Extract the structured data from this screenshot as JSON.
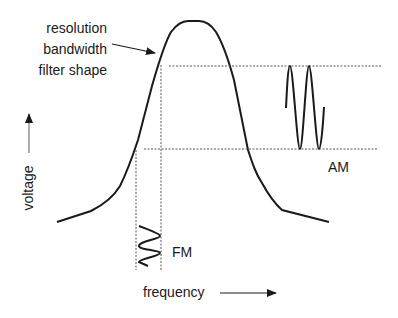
{
  "diagram": {
    "filter_label": [
      "resolution",
      "bandwidth",
      "filter shape"
    ],
    "am_label": "AM",
    "fm_label": "FM",
    "x_axis_label": "frequency",
    "y_axis_label": "voltage"
  },
  "colors": {
    "curve": "#1a1a1a",
    "dashed": "#555555",
    "axis_arrow": "#777777"
  }
}
